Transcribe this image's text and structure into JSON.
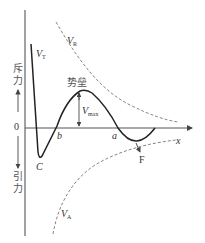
{
  "diagram": {
    "type": "potential-energy-curve",
    "axes": {
      "origin_label": "0",
      "x_label": "x",
      "y_up_label_1": "斥",
      "y_up_label_2": "力",
      "y_down_label_1": "引",
      "y_down_label_2": "力"
    },
    "curves": {
      "total": {
        "label_main": "V",
        "label_sub": "T",
        "style": "solid"
      },
      "repulsive": {
        "label_main": "V",
        "label_sub": "R",
        "style": "dashed"
      },
      "attractive": {
        "label_main": "V",
        "label_sub": "A",
        "style": "dashed"
      }
    },
    "annotations": {
      "barrier": "势垒",
      "vmax_main": "V",
      "vmax_sub": "max",
      "point_a": "a",
      "point_b": "b",
      "point_c": "C",
      "point_f": "F"
    },
    "colors": {
      "line": "#222222",
      "dashed": "#666666",
      "text": "#333333"
    }
  }
}
